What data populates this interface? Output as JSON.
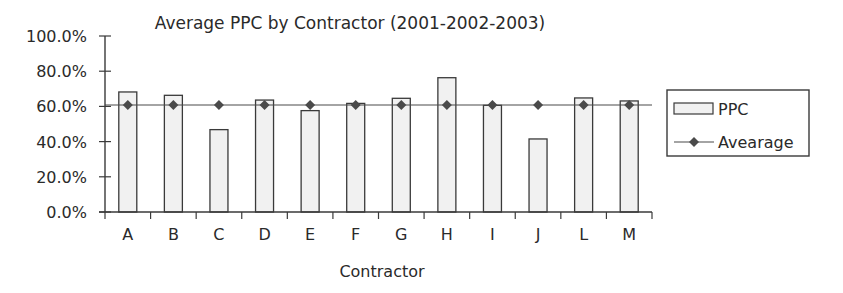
{
  "chart_data": {
    "type": "bar",
    "title": "Average PPC by Contractor (2001-2002-2003)",
    "xlabel": "Contractor",
    "ylabel": "",
    "categories": [
      "A",
      "B",
      "C",
      "D",
      "E",
      "F",
      "G",
      "H",
      "I",
      "J",
      "L",
      "M"
    ],
    "series": [
      {
        "name": "PPC",
        "kind": "bar",
        "values": [
          68.2,
          66.3,
          46.8,
          63.6,
          57.6,
          61.7,
          64.6,
          76.3,
          60.6,
          41.5,
          64.8,
          63.1
        ]
      },
      {
        "name": "Avearage",
        "kind": "line",
        "marker": "diamond",
        "values": [
          60.8,
          60.8,
          60.8,
          60.8,
          60.8,
          60.8,
          60.8,
          60.8,
          60.8,
          60.8,
          60.8,
          60.8
        ]
      }
    ],
    "ylim": [
      0,
      100
    ],
    "yticks": [
      "0.0%",
      "20.0%",
      "40.0%",
      "60.0%",
      "80.0%",
      "100.0%"
    ],
    "grid": false,
    "legend_position": "right"
  },
  "colors": {
    "bar_fill": "#f1f1f1",
    "bar_stroke": "#3a3a3a",
    "line": "#4a4a4a",
    "marker": "#4a4a4a",
    "axis": "#3a3a3a",
    "legend_border": "#3a3a3a"
  }
}
